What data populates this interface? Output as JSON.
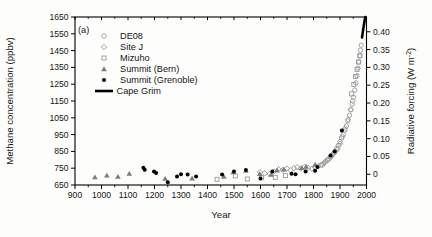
{
  "figure": {
    "panel_label": "(a)",
    "background": "#fdfdfc",
    "frame_color": "#000000"
  },
  "chart_data": {
    "type": "scatter",
    "title": "",
    "x_axis": {
      "label": "Year",
      "min": 900,
      "max": 2000,
      "major_ticks": [
        900,
        1000,
        1100,
        1200,
        1300,
        1400,
        1500,
        1600,
        1700,
        1800,
        1900,
        2000
      ],
      "minor_ticks": [
        950,
        1050,
        1150,
        1250,
        1350,
        1450,
        1550,
        1650,
        1750,
        1850,
        1950
      ]
    },
    "y_left": {
      "label": "Methane concentration (ppbv)",
      "min": 650,
      "max": 1650,
      "ticks": [
        650,
        750,
        850,
        950,
        1050,
        1150,
        1250,
        1350,
        1450,
        1550,
        1650
      ]
    },
    "y_right": {
      "label_pre": "Radiative forcing (W m",
      "label_sup": "-2",
      "label_post": ")",
      "ticks": [
        {
          "label": "0",
          "ppbv": 714
        },
        {
          "label": "0.05",
          "ppbv": 820
        },
        {
          "label": "0.10",
          "ppbv": 926
        },
        {
          "label": "0.15",
          "ppbv": 1032
        },
        {
          "label": "0.20",
          "ppbv": 1138
        },
        {
          "label": "0.25",
          "ppbv": 1244
        },
        {
          "label": "0.30",
          "ppbv": 1350
        },
        {
          "label": "0.35",
          "ppbv": 1456
        },
        {
          "label": "0.40",
          "ppbv": 1562
        }
      ]
    },
    "legend_position": "top-left-inside",
    "grid": false,
    "series": [
      {
        "name": "DE08",
        "marker": "circle",
        "color": "#9a9a9a",
        "points": [
          [
            1832,
            768
          ],
          [
            1839,
            778
          ],
          [
            1846,
            790
          ],
          [
            1852,
            798
          ],
          [
            1858,
            806
          ],
          [
            1864,
            816
          ],
          [
            1870,
            826
          ],
          [
            1876,
            838
          ],
          [
            1882,
            852
          ],
          [
            1888,
            868
          ],
          [
            1894,
            885
          ],
          [
            1900,
            908
          ],
          [
            1906,
            930
          ],
          [
            1912,
            952
          ],
          [
            1918,
            976
          ],
          [
            1924,
            1002
          ],
          [
            1930,
            1032
          ],
          [
            1936,
            1065
          ],
          [
            1941,
            1098
          ],
          [
            1946,
            1132
          ],
          [
            1951,
            1172
          ],
          [
            1956,
            1215
          ],
          [
            1960,
            1258
          ],
          [
            1964,
            1300
          ],
          [
            1968,
            1345
          ],
          [
            1971,
            1382
          ],
          [
            1974,
            1418
          ],
          [
            1977,
            1452
          ],
          [
            1980,
            1482
          ]
        ]
      },
      {
        "name": "Site J",
        "marker": "diamond",
        "color": "#9a9a9a",
        "points": [
          [
            1598,
            727
          ],
          [
            1616,
            719
          ],
          [
            1634,
            716
          ],
          [
            1650,
            729
          ],
          [
            1668,
            744
          ],
          [
            1684,
            740
          ],
          [
            1700,
            748
          ],
          [
            1714,
            738
          ],
          [
            1726,
            750
          ],
          [
            1738,
            756
          ],
          [
            1752,
            749
          ],
          [
            1766,
            757
          ],
          [
            1780,
            752
          ],
          [
            1794,
            747
          ],
          [
            1806,
            756
          ],
          [
            1818,
            762
          ],
          [
            1830,
            772
          ],
          [
            1842,
            786
          ],
          [
            1854,
            800
          ],
          [
            1866,
            818
          ],
          [
            1878,
            840
          ],
          [
            1890,
            862
          ],
          [
            1900,
            895
          ],
          [
            1910,
            938
          ],
          [
            1920,
            988
          ],
          [
            1930,
            1040
          ],
          [
            1940,
            1098
          ],
          [
            1948,
            1150
          ]
        ]
      },
      {
        "name": "Mizuho",
        "marker": "square",
        "color": "#9a9a9a",
        "points": [
          [
            1436,
            684
          ],
          [
            1505,
            704
          ],
          [
            1550,
            686
          ],
          [
            1604,
            693
          ],
          [
            1656,
            696
          ],
          [
            1694,
            706
          ],
          [
            1944,
            1192
          ],
          [
            1952,
            1248
          ],
          [
            1958,
            1296
          ],
          [
            1964,
            1338
          ],
          [
            1970,
            1382
          ],
          [
            1975,
            1420
          ]
        ]
      },
      {
        "name": "Summit (Bern)",
        "marker": "triangle",
        "color": "#7d7d7d",
        "points": [
          [
            975,
            697
          ],
          [
            1020,
            707
          ],
          [
            1062,
            700
          ],
          [
            1105,
            718
          ],
          [
            1240,
            688
          ],
          [
            1342,
            690
          ],
          [
            1462,
            700
          ],
          [
            1497,
            727
          ],
          [
            1545,
            736
          ],
          [
            1597,
            716
          ],
          [
            1640,
            712
          ],
          [
            1663,
            737
          ],
          [
            1688,
            744
          ],
          [
            1755,
            752
          ],
          [
            1772,
            760
          ],
          [
            1806,
            772
          ]
        ]
      },
      {
        "name": "Summit (Grenoble)",
        "marker": "filled-circle",
        "color": "#000000",
        "points": [
          [
            1158,
            753
          ],
          [
            1163,
            741
          ],
          [
            1198,
            730
          ],
          [
            1206,
            722
          ],
          [
            1250,
            666
          ],
          [
            1285,
            700
          ],
          [
            1300,
            714
          ],
          [
            1325,
            712
          ],
          [
            1357,
            700
          ],
          [
            1455,
            712
          ],
          [
            1500,
            730
          ],
          [
            1545,
            740
          ],
          [
            1600,
            688
          ],
          [
            1645,
            730
          ],
          [
            1717,
            717
          ],
          [
            1732,
            714
          ],
          [
            1770,
            731
          ],
          [
            1806,
            735
          ],
          [
            1815,
            758
          ],
          [
            1864,
            825
          ],
          [
            1880,
            850
          ],
          [
            1907,
            975
          ]
        ]
      },
      {
        "name": "Cape Grim",
        "marker": "line",
        "color": "#000000",
        "points": [
          [
            1983,
            1528
          ],
          [
            1986,
            1560
          ],
          [
            1989,
            1592
          ],
          [
            1992,
            1620
          ],
          [
            1994,
            1640
          ],
          [
            1996,
            1650
          ]
        ]
      }
    ]
  }
}
